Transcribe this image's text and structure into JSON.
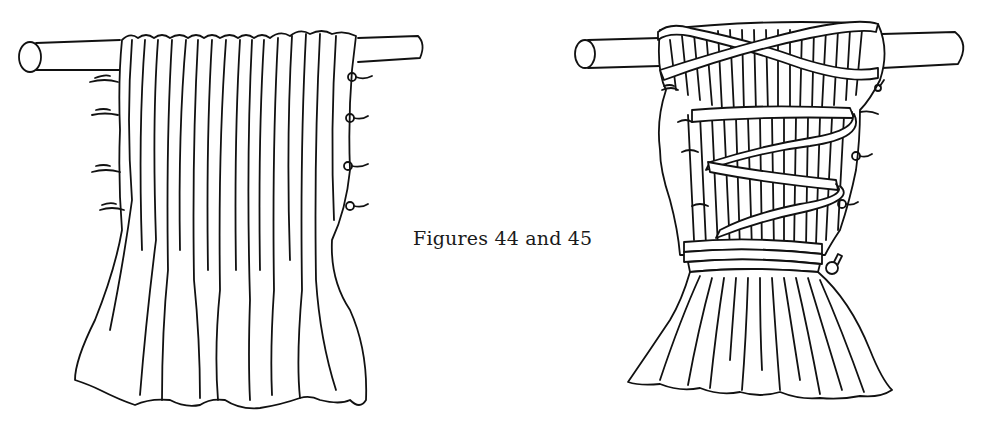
{
  "caption": "Figures 44 and 45",
  "figures": [
    {
      "id": "figure-44",
      "description": "Pleated cloth hanging from a rod, with threads tied at the sides"
    },
    {
      "id": "figure-45",
      "description": "Same pleated cloth bound with cord spirally wrapped around it on a rod"
    }
  ],
  "colors": {
    "ink": "#111111",
    "background": "#ffffff"
  }
}
